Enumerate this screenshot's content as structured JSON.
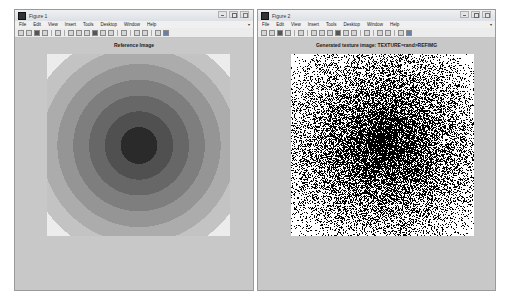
{
  "windows": [
    {
      "title": "Figure 1",
      "menu": [
        "File",
        "Edit",
        "View",
        "Insert",
        "Tools",
        "Desktop",
        "Window",
        "Help"
      ],
      "plot_title": "Reference Image"
    },
    {
      "title": "Figure 2",
      "menu": [
        "File",
        "Edit",
        "View",
        "Insert",
        "Tools",
        "Desktop",
        "Window",
        "Help"
      ],
      "plot_title": "Generated texture image: TEXTURE=rand>REFIMG"
    }
  ],
  "toolbar_icons": [
    "new-figure-icon",
    "open-file-icon",
    "save-icon",
    "print-icon",
    "edit-plot-icon",
    "zoom-in-icon",
    "zoom-out-icon",
    "pan-icon",
    "rotate-3d-icon",
    "data-cursor-icon",
    "brush-icon",
    "link-plot-icon",
    "colorbar-icon",
    "legend-icon",
    "hide-plot-tools-icon",
    "show-plot-tools-icon"
  ],
  "colors": {
    "ring_shades": [
      "#ececec",
      "#c3c3c3",
      "#acacac",
      "#959595",
      "#7e7e7e",
      "#676767",
      "#505050",
      "#2a2a2a"
    ]
  }
}
